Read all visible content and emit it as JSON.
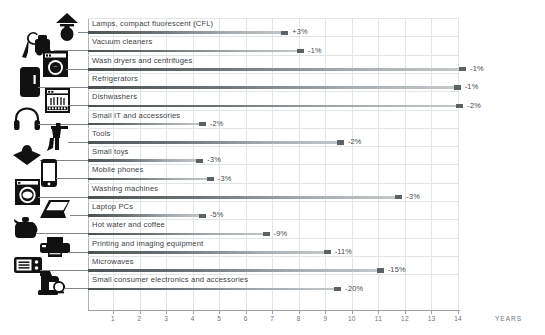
{
  "chart_data": {
    "type": "bar",
    "orientation": "horizontal",
    "title": "",
    "xlabel": "YEARS",
    "ylabel": "",
    "xlim": [
      0,
      14.9
    ],
    "grid": true,
    "legend": false,
    "tick_labels": [
      "1",
      "2",
      "3",
      "4",
      "5",
      "6",
      "7",
      "8",
      "9",
      "10",
      "11",
      "12",
      "13",
      "14"
    ],
    "tick_values": [
      1,
      2,
      3,
      4,
      5,
      6,
      7,
      8,
      9,
      10,
      11,
      12,
      13,
      14
    ],
    "categories": [
      "Lamps, compact fluorescent (CFL)",
      "Vacuum cleaners",
      "Wash dryers and centrifuges",
      "Refrigerators",
      "Dishwashers",
      "Small IT and accessories",
      "Tools",
      "Small toys",
      "Mobile phones",
      "Washing machines",
      "Laptop PCs",
      "Hot water and coffee",
      "Printing and imaging equipment",
      "Microwaves",
      "Small consumer electronics and accessories"
    ],
    "values": [
      7.6,
      8.2,
      14.3,
      14.1,
      14.2,
      4.5,
      9.7,
      4.4,
      4.8,
      11.9,
      4.5,
      6.9,
      9.2,
      11.2,
      9.6
    ],
    "data_labels": [
      "+3%",
      "-1%",
      "-1%",
      "-1%",
      "-2%",
      "-2%",
      "-2%",
      "-3%",
      "-3%",
      "-3%",
      "-5%",
      "-9%",
      "-11%",
      "-15%",
      "-20%"
    ],
    "icons": [
      "lamp-cfl-icon",
      "vacuum-cleaner-icon",
      "wash-dryer-icon",
      "refrigerator-icon",
      "dishwasher-icon",
      "headphones-icon",
      "power-tool-icon",
      "spinning-top-toy-icon",
      "mobile-phone-icon",
      "washing-machine-icon",
      "laptop-icon",
      "kettle-icon",
      "printer-icon",
      "microwave-icon",
      "coffee-machine-icon"
    ],
    "colors": {
      "bar_dark": "#4c5154",
      "bar_light": "#c6cacd",
      "bar_tip": "#5c6165",
      "grid": "#e2e5e7",
      "axis": "#9aa0a5",
      "text": "#3d4245",
      "background": "#ffffff"
    }
  }
}
